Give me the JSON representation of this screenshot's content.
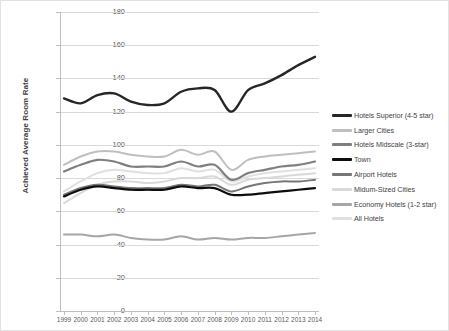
{
  "chart_data": {
    "type": "line",
    "title": "",
    "xlabel": "",
    "ylabel": "Achieved Average Room Rate",
    "ylim": [
      0,
      180
    ],
    "ytick_step": 20,
    "yticks": [
      0,
      20,
      40,
      60,
      80,
      100,
      120,
      140,
      160,
      180
    ],
    "grid": true,
    "legend_position": "right",
    "categories": [
      1999,
      2000,
      2001,
      2002,
      2003,
      2004,
      2005,
      2006,
      2007,
      2008,
      2009,
      2010,
      2011,
      2012,
      2013,
      2014
    ],
    "series": [
      {
        "name": "Hotels Superior (4-5 star)",
        "color": "#262626",
        "width": 2.4,
        "values": [
          128,
          125,
          130,
          131,
          126,
          124,
          125,
          132,
          134,
          133,
          120,
          133,
          137,
          142,
          148,
          153
        ]
      },
      {
        "name": "Larger Cities",
        "color": "#bfbfbf",
        "width": 2.0,
        "values": [
          88,
          93,
          96,
          96,
          94,
          93,
          93,
          97,
          94,
          96,
          85,
          91,
          93,
          94,
          95,
          96
        ]
      },
      {
        "name": "Hotels Midscale (3-star)",
        "color": "#7f7f7f",
        "width": 2.2,
        "values": [
          84,
          88,
          91,
          90,
          87,
          87,
          87,
          90,
          87,
          88,
          79,
          83,
          85,
          87,
          88,
          90
        ]
      },
      {
        "name": "Town",
        "color": "#0d0d0d",
        "width": 2.2,
        "values": [
          69,
          73,
          75,
          74,
          73,
          73,
          73,
          75,
          74,
          74,
          70,
          70,
          71,
          72,
          73,
          74
        ]
      },
      {
        "name": "Airport Hotels",
        "color": "#767676",
        "width": 2.0,
        "values": [
          70,
          74,
          76,
          75,
          74,
          74,
          74,
          76,
          75,
          76,
          72,
          75,
          77,
          78,
          78,
          79
        ]
      },
      {
        "name": "Midum-Sized Cities",
        "color": "#d9d9d9",
        "width": 2.0,
        "values": [
          65,
          71,
          76,
          78,
          78,
          77,
          78,
          80,
          80,
          81,
          76,
          79,
          80,
          81,
          82,
          83
        ]
      },
      {
        "name": "Economy Hotels (1-2 star)",
        "color": "#a6a6a6",
        "width": 2.0,
        "values": [
          46,
          46,
          45,
          46,
          44,
          43,
          43,
          45,
          43,
          44,
          43,
          44,
          44,
          45,
          46,
          47
        ]
      },
      {
        "name": "All Hotels",
        "color": "#e0e0e0",
        "width": 2.0,
        "values": [
          72,
          78,
          83,
          85,
          84,
          83,
          83,
          86,
          84,
          85,
          78,
          81,
          83,
          84,
          85,
          86
        ]
      }
    ]
  },
  "legend": {
    "items": [
      {
        "label": "Hotels Superior (4-5 star)",
        "color": "#262626"
      },
      {
        "label": "Larger Cities",
        "color": "#bfbfbf"
      },
      {
        "label": "Hotels Midscale (3-star)",
        "color": "#7f7f7f"
      },
      {
        "label": "Town",
        "color": "#0d0d0d"
      },
      {
        "label": "Airport Hotels",
        "color": "#767676"
      },
      {
        "label": "Midum-Sized Cities",
        "color": "#d9d9d9"
      },
      {
        "label": "Economy Hotels (1-2 star)",
        "color": "#a6a6a6"
      },
      {
        "label": "All Hotels",
        "color": "#e0e0e0"
      }
    ]
  }
}
